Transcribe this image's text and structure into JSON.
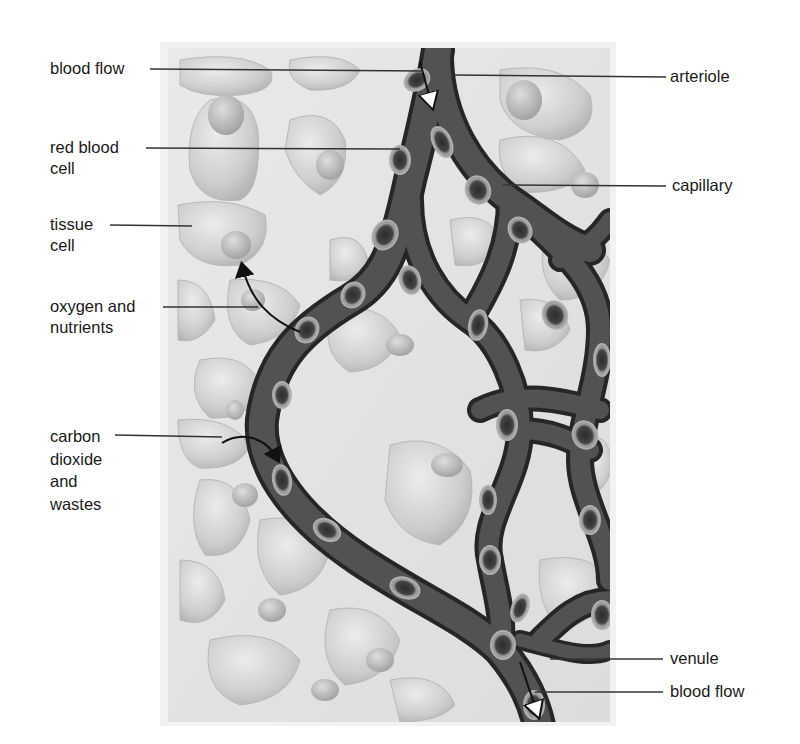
{
  "figure": {
    "style": "grayscale illustration",
    "colors": {
      "background": "#ffffff",
      "tissue_bg": "#e4e4e4",
      "tissue_cell": "#cfcfcf",
      "nucleus": "#b5b5b5",
      "vessel": "#4a4a4a",
      "vessel_edge": "#2a2a2a",
      "rbc_ring": "#9a9a9a",
      "rbc_core": "#3a3a3a",
      "leader_line": "#333333",
      "text": "#1a1a1a"
    }
  },
  "labels": {
    "left": [
      {
        "id": "blood-flow-in",
        "text": "blood flow",
        "x": 50,
        "y": 58
      },
      {
        "id": "red-blood-cell",
        "text": "red blood\ncell",
        "x": 50,
        "y": 136
      },
      {
        "id": "tissue-cell",
        "text": "tissue\ncell",
        "x": 50,
        "y": 213
      },
      {
        "id": "oxygen-nutrients",
        "text": "oxygen and\nnutrients",
        "x": 50,
        "y": 296
      },
      {
        "id": "co2-wastes",
        "text": "carbon\ndioxide\nand\nwastes",
        "x": 50,
        "y": 427
      }
    ],
    "right": [
      {
        "id": "arteriole",
        "text": "arteriole",
        "x": 670,
        "y": 66
      },
      {
        "id": "capillary",
        "text": "capillary",
        "x": 672,
        "y": 175
      },
      {
        "id": "venule",
        "text": "venule",
        "x": 670,
        "y": 650
      },
      {
        "id": "blood-flow-out",
        "text": "blood flow",
        "x": 670,
        "y": 682
      }
    ]
  }
}
